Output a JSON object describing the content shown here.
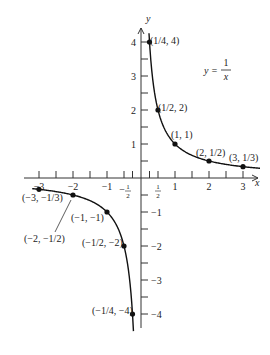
{
  "chart_data": {
    "type": "line",
    "title": "",
    "equation": "y = 1/x",
    "equation_label": {
      "lhs": "y =",
      "num": "1",
      "den": "x"
    },
    "xlabel": "x",
    "ylabel": "y",
    "xlim": [
      -3.2,
      3.6
    ],
    "ylim": [
      -4.5,
      4.3
    ],
    "grid": false,
    "x_ticks": [
      -3,
      -2.5,
      -2,
      -1.5,
      -1,
      -0.5,
      -0.25,
      0.25,
      0.5,
      1,
      1.5,
      2,
      2.5,
      3
    ],
    "x_tick_labels": [
      {
        "value": -3,
        "label": "-3"
      },
      {
        "value": -2,
        "label": "-2"
      },
      {
        "value": -1,
        "label": "-1"
      },
      {
        "value": -0.5,
        "label": "-1/2"
      },
      {
        "value": 0.5,
        "label": "1/2"
      },
      {
        "value": 1,
        "label": "1"
      },
      {
        "value": 2,
        "label": "2"
      },
      {
        "value": 3,
        "label": "3"
      }
    ],
    "y_ticks": [
      4,
      3.5,
      3,
      2.5,
      2,
      1.5,
      1,
      0.5,
      -0.5,
      -1,
      -1.5,
      -2,
      -2.5,
      -3,
      -3.5,
      -4
    ],
    "y_tick_labels": [
      {
        "value": 4,
        "label": "4"
      },
      {
        "value": 3,
        "label": "3"
      },
      {
        "value": 2,
        "label": "2"
      },
      {
        "value": 1,
        "label": "1"
      },
      {
        "value": -0.5,
        "label": "-1/2"
      },
      {
        "value": -1,
        "label": "-1"
      },
      {
        "value": -2,
        "label": "-2"
      },
      {
        "value": -3,
        "label": "-3"
      },
      {
        "value": -4,
        "label": "-4"
      }
    ],
    "series": [
      {
        "name": "y = 1/x (x > 0)",
        "points": [
          {
            "x": 0.25,
            "y": 4,
            "label": "(1/4, 4)"
          },
          {
            "x": 0.5,
            "y": 2,
            "label": "(1/2, 2)"
          },
          {
            "x": 1,
            "y": 1,
            "label": "(1, 1)"
          },
          {
            "x": 2,
            "y": 0.5,
            "label": "(2, 1/2)"
          },
          {
            "x": 3,
            "y": 0.3333,
            "label": "(3, 1/3)"
          }
        ]
      },
      {
        "name": "y = 1/x (x < 0)",
        "points": [
          {
            "x": -3,
            "y": -0.3333,
            "label": "(-3, -1/3)"
          },
          {
            "x": -2,
            "y": -0.5,
            "label": "(-2, -1/2)"
          },
          {
            "x": -1,
            "y": -1,
            "label": "(-1, -1)"
          },
          {
            "x": -0.5,
            "y": -2,
            "label": "(-1/2, -2)"
          },
          {
            "x": -0.25,
            "y": -4,
            "label": "(-1/4, -4)"
          }
        ]
      }
    ]
  },
  "labels": {
    "x_axis": "x",
    "y_axis": "y",
    "eq_lhs": "y =",
    "eq_num": "1",
    "eq_den": "x"
  }
}
